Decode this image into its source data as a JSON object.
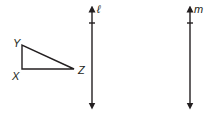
{
  "diagram": {
    "stroke_color": "#231f20",
    "background": "#ffffff",
    "triangle": {
      "vertices": {
        "X": {
          "label": "X",
          "x": 22,
          "y": 69
        },
        "Y": {
          "label": "Y",
          "x": 22,
          "y": 45
        },
        "Z": {
          "label": "Z",
          "x": 74,
          "y": 69
        }
      },
      "right_angle_at": "X"
    },
    "lines": [
      {
        "name": "l",
        "label": "ℓ",
        "x": 92,
        "y_top": 7,
        "y_bottom": 108,
        "tick_y": 23
      },
      {
        "name": "m",
        "label": "m",
        "x": 190,
        "y_top": 7,
        "y_bottom": 108,
        "tick_y": 23
      }
    ]
  }
}
